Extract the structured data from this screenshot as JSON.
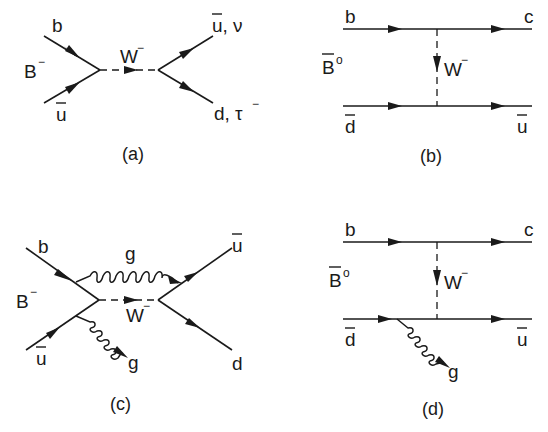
{
  "figure": {
    "panels": [
      {
        "id": "a",
        "caption": "(a)",
        "meson": "B",
        "meson_charge": "−",
        "incoming": [
          {
            "label": "b"
          },
          {
            "label": "u",
            "bar": true
          }
        ],
        "boson": {
          "label": "W",
          "charge": "−"
        },
        "outgoing": [
          {
            "label": "u, ν",
            "bar_on_first": true
          },
          {
            "label": "d, τ",
            "charge": "−"
          }
        ]
      },
      {
        "id": "b",
        "caption": "(b)",
        "meson": "B",
        "meson_charge": "o",
        "meson_bar": true,
        "top_line": {
          "in": "b",
          "out": "c"
        },
        "bottom_line": {
          "in": "d",
          "in_bar": true,
          "out": "u",
          "out_bar": true
        },
        "boson": {
          "label": "W",
          "charge": "−"
        }
      },
      {
        "id": "c",
        "caption": "(c)",
        "meson": "B",
        "meson_charge": "−",
        "incoming": [
          {
            "label": "b"
          },
          {
            "label": "u",
            "bar": true
          }
        ],
        "boson": {
          "label": "W",
          "charge": "−"
        },
        "outgoing": [
          {
            "label": "u",
            "bar": true
          },
          {
            "label": "d"
          }
        ],
        "gluons": [
          {
            "label": "g",
            "type": "exchange"
          },
          {
            "label": "g",
            "type": "emitted"
          }
        ]
      },
      {
        "id": "d",
        "caption": "(d)",
        "meson": "B",
        "meson_charge": "o",
        "meson_bar": true,
        "top_line": {
          "in": "b",
          "out": "c"
        },
        "bottom_line": {
          "in": "d",
          "in_bar": true,
          "out": "u",
          "out_bar": true
        },
        "boson": {
          "label": "W",
          "charge": "−"
        },
        "gluons": [
          {
            "label": "g",
            "type": "emitted"
          }
        ]
      }
    ]
  }
}
